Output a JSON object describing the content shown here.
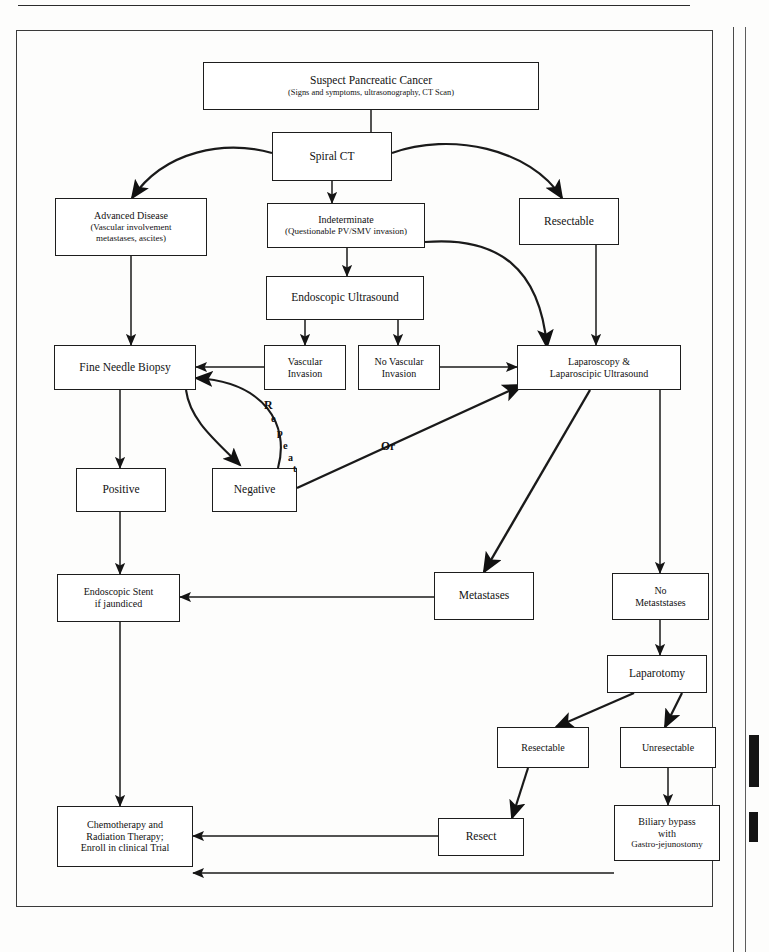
{
  "document": {
    "kind": "clinical-algorithm-flowchart",
    "subject": "Pancreatic cancer staging and management algorithm"
  },
  "nodes": {
    "suspect": {
      "title": "Suspect Pancreatic Cancer",
      "subtitle": "(Signs and symptoms, ultrasonography, CT Scan)"
    },
    "spiral_ct": {
      "title": "Spiral CT"
    },
    "advanced": {
      "title": "Advanced Disease",
      "subtitle": "(Vascular involvement",
      "subtitle2": "metastases, ascites)"
    },
    "indeterminate": {
      "title": "Indeterminate",
      "subtitle": "(Questionable PV/SMV invasion)"
    },
    "resectable_top": {
      "title": "Resectable"
    },
    "eus": {
      "title": "Endoscopic Ultrasound"
    },
    "fnb": {
      "title": "Fine Needle Biopsy"
    },
    "vascular": {
      "title": "Vascular",
      "title2": "Invasion"
    },
    "no_vascular": {
      "title": "No Vascular",
      "title2": "Invasion"
    },
    "laparoscopy": {
      "title": "Laparoscopy &",
      "title2": "Laparoscipic Ultrasound"
    },
    "positive": {
      "title": "Positive"
    },
    "negative": {
      "title": "Negative"
    },
    "stent": {
      "title": "Endoscopic Stent",
      "title2": "if jaundiced"
    },
    "metastases": {
      "title": "Metastases"
    },
    "no_metastases": {
      "title": "No",
      "title2": "Metaststases"
    },
    "laparotomy": {
      "title": "Laparotomy"
    },
    "resectable_bot": {
      "title": "Resectable"
    },
    "unresectable": {
      "title": "Unresectable"
    },
    "chemo": {
      "title": "Chemotherapy and",
      "title2": "Radiation Therapy;",
      "title3": "Enroll in clinical Trial"
    },
    "resect": {
      "title": "Resect"
    },
    "biliary": {
      "title": "Biliary bypass",
      "title2": "with",
      "title3": "Gastro-jejunostomy"
    }
  },
  "edge_labels": {
    "repeat": "Repeat",
    "repeat_letters": [
      "R",
      "e",
      "p",
      "e",
      "a",
      "t"
    ],
    "or": "Or"
  },
  "colors": {
    "ink": "#121212",
    "line": "#1d1d1d",
    "paper": "#fdfdfc",
    "frame": "#3a3a3a"
  }
}
